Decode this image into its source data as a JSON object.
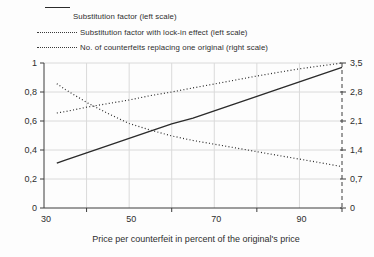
{
  "legend": {
    "items": [
      {
        "id": "substitution-factor",
        "label": "Substitution factor (left scale)",
        "style": "solid"
      },
      {
        "id": "substitution-factor-lock-in",
        "label": "Substitution factor with lock-in effect (left scale)",
        "style": "dotted"
      },
      {
        "id": "counterfeits-replacing-original",
        "label": "No. of counterfeits replacing one original (right scale)",
        "style": "dotted"
      }
    ]
  },
  "chart_data": {
    "type": "line",
    "title": "",
    "xlabel": "Price per counterfeit in percent of the original's price",
    "xlim": [
      30,
      100
    ],
    "grid": true,
    "legend_position": "top-left",
    "x_axis": {
      "tick_labels": [
        "30",
        "50",
        "70",
        "90"
      ],
      "tick_label_values": [
        30,
        50,
        70,
        90
      ],
      "minor_tick_values": [
        40,
        60,
        80,
        100
      ],
      "gridline_values": [
        40,
        50,
        60,
        70,
        80,
        90
      ]
    },
    "left_axis": {
      "tick_labels": [
        "1",
        "0,8",
        "0,6",
        "0,4",
        "0,2",
        "0"
      ],
      "tick_values": [
        1,
        0.8,
        0.6,
        0.4,
        0.2,
        0
      ],
      "lim": [
        0,
        1
      ],
      "line_style": "solid"
    },
    "right_axis": {
      "tick_labels": [
        "3,5",
        "2,8",
        "2,1",
        "1,4",
        "0,7",
        "0"
      ],
      "tick_values": [
        3.5,
        2.8,
        2.1,
        1.4,
        0.7,
        0
      ],
      "lim": [
        0,
        3.5
      ],
      "line_style": "dashed"
    },
    "x": [
      33,
      35,
      40,
      45,
      50,
      55,
      60,
      65,
      70,
      75,
      80,
      85,
      90,
      95,
      100
    ],
    "series": [
      {
        "id": "substitution-factor",
        "name": "Substitution factor (left scale)",
        "axis": "left",
        "style": "solid",
        "values": [
          0.31,
          0.33,
          0.38,
          0.43,
          0.48,
          0.53,
          0.58,
          0.62,
          0.67,
          0.72,
          0.77,
          0.82,
          0.87,
          0.92,
          0.97
        ]
      },
      {
        "id": "substitution-factor-lock-in",
        "name": "Substitution factor with lock-in effect (left scale)",
        "axis": "left",
        "style": "dotted",
        "values": [
          0.655,
          0.665,
          0.695,
          0.72,
          0.745,
          0.775,
          0.8,
          0.828,
          0.855,
          0.883,
          0.91,
          0.935,
          0.96,
          0.98,
          1.0
        ]
      },
      {
        "id": "counterfeits-replacing-original",
        "name": "No. of counterfeits replacing one original (right scale)",
        "axis": "right",
        "style": "dotted",
        "values": [
          3.0,
          2.86,
          2.55,
          2.28,
          2.04,
          1.88,
          1.74,
          1.63,
          1.54,
          1.45,
          1.36,
          1.27,
          1.18,
          1.09,
          1.0
        ]
      }
    ]
  },
  "colors": {
    "line": "#2b2b2b",
    "axis": "#3c3c3c",
    "grid": "#dadada",
    "text": "#2e2e2e",
    "background": "#fdfdfd"
  }
}
